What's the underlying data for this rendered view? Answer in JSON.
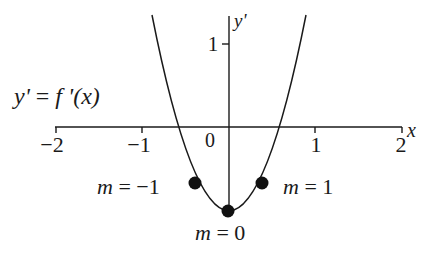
{
  "diagram": {
    "function_label": "y' = f '(x)",
    "function_label_parts": {
      "lhs": "y'",
      "eq": " = ",
      "rhs": "f '(x)"
    },
    "x_axis_label": "x",
    "y_axis_label": "y'",
    "x_ticks": [
      "−2",
      "−1",
      "0",
      "1",
      "2"
    ],
    "y_ticks": [
      "1"
    ],
    "points": [
      {
        "label": "m = −1",
        "label_m": "m",
        "label_rest": " = −1",
        "x": -0.333,
        "y": -0.667
      },
      {
        "label": "m = 0",
        "label_m": "m",
        "label_rest": " = 0",
        "x": 0,
        "y": -1
      },
      {
        "label": "m = 1",
        "label_m": "m",
        "label_rest": " = 1",
        "x": 0.333,
        "y": -0.667
      }
    ],
    "curve": "y' = 3x^2 - 1",
    "xlim": [
      -2,
      2
    ],
    "ylim": [
      -1,
      1.35
    ],
    "colors": {
      "stroke": "#1a1a1a",
      "background": "#ffffff"
    }
  }
}
